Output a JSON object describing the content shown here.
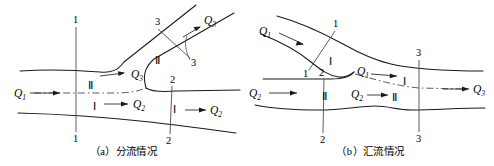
{
  "figure": {
    "kind": "hydraulics-channel-junction-diagram",
    "panels": [
      {
        "id": "a",
        "caption": "（a）分流情况",
        "caption_label": "(a)",
        "caption_text": "分流情况",
        "description": "dividing-flow",
        "discharges": [
          {
            "name": "Q1",
            "base": "Q",
            "sub": "1",
            "x": 14,
            "y": 94
          },
          {
            "name": "Q3",
            "base": "Q",
            "sub": "3",
            "x": 131,
            "y": 77
          },
          {
            "name": "Q2",
            "base": "Q",
            "sub": "2",
            "x": 133,
            "y": 106
          },
          {
            "name": "Q3",
            "base": "Q",
            "sub": "3",
            "x": 206,
            "y": 31
          },
          {
            "name": "Q2",
            "base": "Q",
            "sub": "2",
            "x": 211,
            "y": 112
          }
        ],
        "sections": [
          {
            "label": "1",
            "x": 76,
            "y": 23
          },
          {
            "label": "1",
            "x": 76,
            "y": 137
          },
          {
            "label": "3",
            "x": 161,
            "y": 24
          },
          {
            "label": "3",
            "x": 193,
            "y": 63
          },
          {
            "label": "2",
            "x": 175,
            "y": 81
          },
          {
            "label": "2",
            "x": 170,
            "y": 139
          }
        ],
        "zones": [
          {
            "label": "II",
            "x": 91,
            "y": 86
          },
          {
            "label": "I",
            "x": 95,
            "y": 108
          },
          {
            "label": "II",
            "x": 159,
            "y": 61
          },
          {
            "label": "I",
            "x": 176,
            "y": 110
          }
        ]
      },
      {
        "id": "b",
        "caption": "（b）汇流情况",
        "caption_label": "(b)",
        "caption_text": "汇流情况",
        "description": "combining-flow",
        "discharges": [
          {
            "name": "Q1",
            "base": "Q",
            "sub": "1",
            "x": 14,
            "y": 33
          },
          {
            "name": "Q2",
            "base": "Q",
            "sub": "2",
            "x": 4,
            "y": 95
          },
          {
            "name": "Q1",
            "base": "Q",
            "sub": "1",
            "x": 112,
            "y": 77
          },
          {
            "name": "Q2",
            "base": "Q",
            "sub": "2",
            "x": 107,
            "y": 97
          },
          {
            "name": "Q3",
            "base": "Q",
            "sub": "3",
            "x": 228,
            "y": 92
          }
        ],
        "sections": [
          {
            "label": "1",
            "x": 85,
            "y": 26
          },
          {
            "label": "1",
            "x": 60,
            "y": 74
          },
          {
            "label": "2",
            "x": 75,
            "y": 74
          },
          {
            "label": "2",
            "x": 76,
            "y": 138
          },
          {
            "label": "3",
            "x": 172,
            "y": 55
          },
          {
            "label": "3",
            "x": 172,
            "y": 137
          }
        ],
        "zones": [
          {
            "label": "I",
            "x": 84,
            "y": 62
          },
          {
            "label": "II",
            "x": 78,
            "y": 97
          },
          {
            "label": "I",
            "x": 158,
            "y": 82
          },
          {
            "label": "II",
            "x": 148,
            "y": 99
          }
        ]
      }
    ],
    "colors": {
      "wall": "#1a1a1a",
      "section_line": "#4a4a4a",
      "flow_centerline": "#4a4a4a",
      "arrow": "#2a2a2a",
      "background": "#ffffff"
    }
  }
}
